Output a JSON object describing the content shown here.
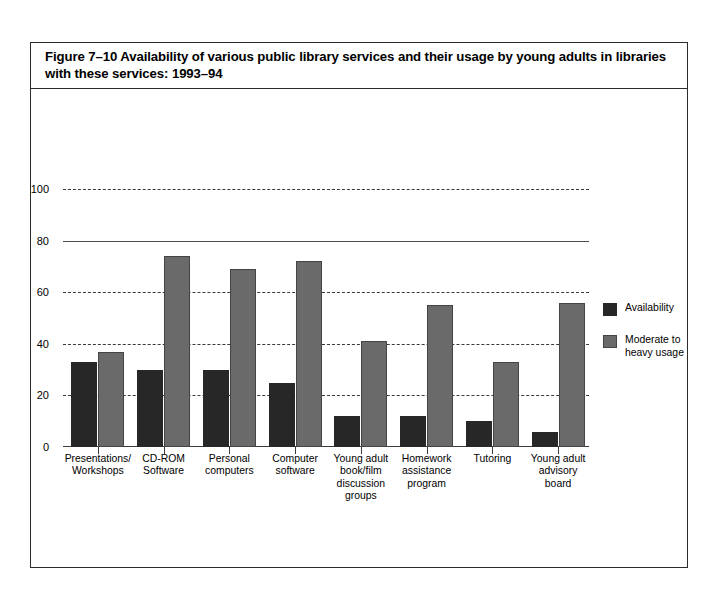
{
  "figure": {
    "title": "Figure 7–10  Availability of various public library services and their usage by young adults in libraries with these services: 1993–94"
  },
  "legend": {
    "items": [
      {
        "label": "Availability",
        "color": "#272727",
        "swatch_name": "legend-swatch-availability"
      },
      {
        "label": "Moderate to\nheavy usage",
        "color": "#6a6a6a",
        "swatch_name": "legend-swatch-usage"
      }
    ]
  },
  "axis": {
    "y_ticks": [
      "0",
      "20",
      "40",
      "60",
      "80",
      "100"
    ],
    "y_tick_values": [
      0,
      20,
      40,
      60,
      80,
      100
    ]
  },
  "chart_data": {
    "type": "bar",
    "title": "Figure 7–10  Availability of various public library services and their usage by young adults in libraries with these services: 1993–94",
    "xlabel": "",
    "ylabel": "",
    "ylim": [
      0,
      100
    ],
    "yticks": [
      0,
      20,
      40,
      60,
      80,
      100
    ],
    "grid": true,
    "legend_position": "right",
    "categories": [
      "Presentations/\nWorkshops",
      "CD-ROM\nSoftware",
      "Personal\ncomputers",
      "Computer\nsoftware",
      "Young adult\nbook/film\ndiscussion\ngroups",
      "Homework\nassistance\nprogram",
      "Tutoring",
      "Young adult\nadvisory\nboard"
    ],
    "series": [
      {
        "name": "Availability",
        "color": "#272727",
        "values": [
          33,
          30,
          30,
          25,
          12,
          12,
          10,
          6
        ]
      },
      {
        "name": "Moderate to heavy usage",
        "color": "#6a6a6a",
        "values": [
          37,
          74,
          69,
          72,
          41,
          55,
          33,
          56
        ]
      }
    ]
  }
}
